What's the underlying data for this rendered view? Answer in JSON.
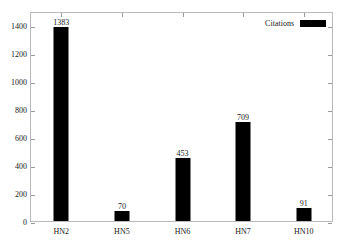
{
  "chart_data": {
    "type": "bar",
    "title": "",
    "xlabel": "",
    "ylabel": "",
    "categories": [
      "HN2",
      "HN5",
      "HN6",
      "HN7",
      "HN10"
    ],
    "values": [
      1383,
      70,
      453,
      709,
      91
    ],
    "value_labels": [
      "1383",
      "70",
      "453",
      "709",
      "91"
    ],
    "series": [
      {
        "name": "Citations",
        "values": [
          1383,
          70,
          453,
          709,
          91
        ]
      }
    ],
    "ylim": [
      0,
      1500
    ],
    "yticks": [
      0,
      200,
      400,
      600,
      800,
      1000,
      1200,
      1400
    ],
    "ytick_labels": [
      "0",
      "200",
      "400",
      "600",
      "800",
      "1000",
      "1200",
      "1400"
    ],
    "grid": false,
    "legend_position": "top-right",
    "bar_color": "#000000",
    "frame_color": "#b9b9b9",
    "background_color": "#ffffff"
  },
  "legend": {
    "entries": [
      {
        "label": "Citations",
        "color": "#000000"
      }
    ]
  }
}
